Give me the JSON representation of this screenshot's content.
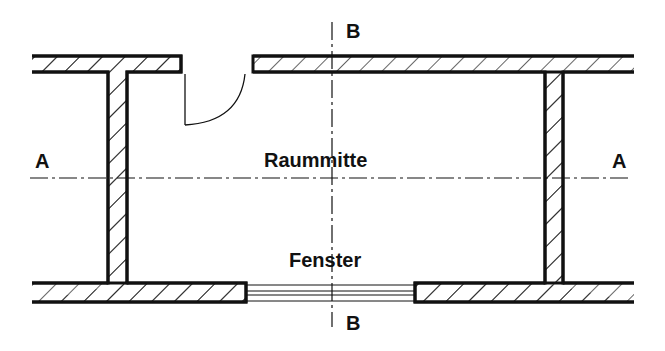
{
  "diagram": {
    "type": "floor-plan-section",
    "labels": {
      "section_a_left": "A",
      "section_a_right": "A",
      "section_b_top": "B",
      "section_b_bottom": "B",
      "room_center": "Raummitte",
      "window": "Fenster"
    },
    "colors": {
      "line": "#111111",
      "background": "#ffffff"
    }
  }
}
